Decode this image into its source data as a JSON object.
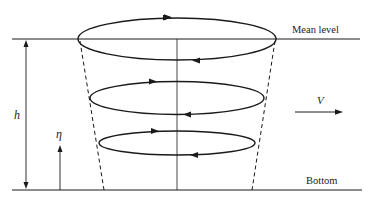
{
  "diagram": {
    "labels": {
      "mean_level": "Mean level",
      "bottom": "Bottom",
      "depth": "h",
      "height_coord": "η",
      "velocity": "V"
    },
    "colors": {
      "stroke": "#1a1a1a",
      "background": "#ffffff",
      "text": "#222222"
    },
    "elements": {
      "vortex_rings": [
        {
          "level": "top",
          "direction": "counterclockwise-as-viewed",
          "cx": 177,
          "cy": 39,
          "rx": 101,
          "ry": 21
        },
        {
          "level": "middle",
          "direction": "counterclockwise-as-viewed",
          "cx": 177,
          "cy": 98,
          "rx": 87,
          "ry": 17
        },
        {
          "level": "lower",
          "direction": "counterclockwise-as-viewed",
          "cx": 177,
          "cy": 143,
          "rx": 79,
          "ry": 12
        }
      ],
      "cone_outline": "dashed",
      "axis": "vertical center line"
    }
  }
}
